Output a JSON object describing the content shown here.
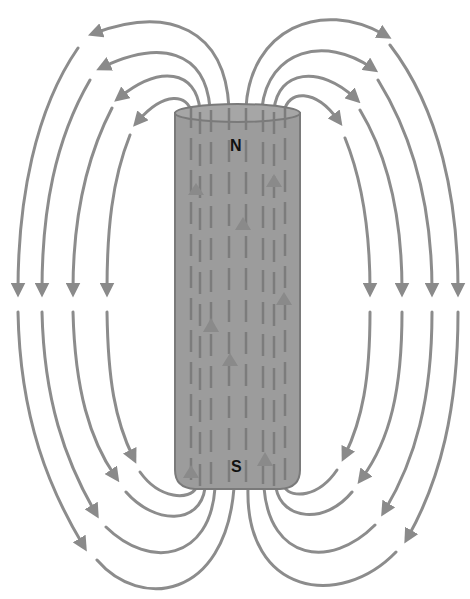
{
  "diagram": {
    "magnet": {
      "north_label": "N",
      "south_label": "S",
      "body_color": "#9c9c9c",
      "edge_color": "#7a7a7a"
    },
    "field_line_color": "#8a8a8a",
    "labels": {
      "north": "N",
      "south": "S"
    },
    "field_line_count_per_side": 4,
    "field_direction": "out of N (top), into S (bottom)",
    "internal_direction": "S to N (upward)"
  }
}
